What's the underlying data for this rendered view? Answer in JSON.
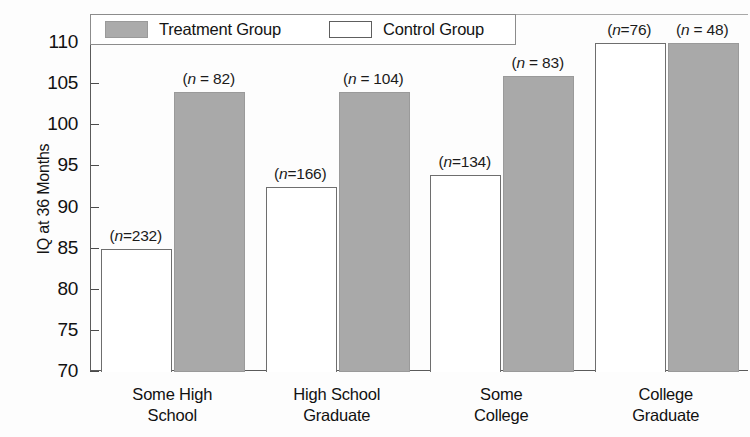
{
  "chart_data": {
    "type": "bar",
    "title": "",
    "xlabel": "",
    "ylabel": "IQ at 36 Months",
    "ylim": [
      70,
      110
    ],
    "yticks": [
      70,
      75,
      80,
      85,
      90,
      95,
      100,
      105,
      110
    ],
    "ytick_labels": [
      "70",
      "75",
      "80",
      "85",
      "90",
      "95",
      "100",
      "105",
      "110"
    ],
    "grid": false,
    "legend_position": "top-left",
    "categories": [
      "Some High\nSchool",
      "High School\nGraduate",
      "Some\nCollege",
      "College\nGraduate"
    ],
    "category_lines": [
      [
        "Some High",
        "School"
      ],
      [
        "High School",
        "Graduate"
      ],
      [
        "Some",
        "College"
      ],
      [
        "College",
        "Graduate"
      ]
    ],
    "series": [
      {
        "name": "Control Group",
        "color": "#ffffff",
        "edge_color": "#6e6e6e",
        "values": [
          85,
          92.5,
          94,
          110
        ],
        "n": [
          232,
          166,
          134,
          76
        ],
        "n_labels": [
          "(n=232)",
          "(n=166)",
          "(n=134)",
          "(n=76)"
        ]
      },
      {
        "name": "Treatment Group",
        "color": "#a9a9a9",
        "edge_color": "#9a9a9a",
        "values": [
          104,
          104,
          106,
          110
        ],
        "n": [
          82,
          104,
          83,
          48
        ],
        "n_labels": [
          "(n = 82)",
          "(n = 104)",
          "(n = 83)",
          "(n = 48)"
        ]
      }
    ]
  },
  "axis": {
    "y_title": "IQ at 36 Months",
    "ticks": [
      {
        "label": "110"
      },
      {
        "label": "105"
      },
      {
        "label": "100"
      },
      {
        "label": "95"
      },
      {
        "label": "90"
      },
      {
        "label": "85"
      },
      {
        "label": "80"
      },
      {
        "label": "75"
      },
      {
        "label": "70"
      }
    ]
  },
  "legend": {
    "entries": [
      {
        "label": "Treatment Group",
        "swatch": "treatment"
      },
      {
        "label": "Control Group",
        "swatch": "control"
      }
    ]
  },
  "categories": [
    {
      "line1": "Some High",
      "line2": "School"
    },
    {
      "line1": "High School",
      "line2": "Graduate"
    },
    {
      "line1": "Some",
      "line2": "College"
    },
    {
      "line1": "College",
      "line2": "Graduate"
    }
  ],
  "bar_labels": {
    "control": [
      "(n=232)",
      "(n=166)",
      "(n=134)",
      "(n=76)"
    ],
    "treatment": [
      "(n = 82)",
      "(n = 104)",
      "(n = 83)",
      "(n = 48)"
    ]
  }
}
